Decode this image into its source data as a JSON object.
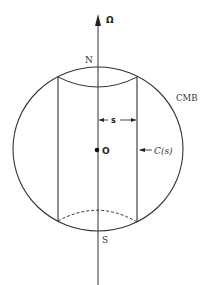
{
  "diagram": {
    "type": "cross-section",
    "labels": {
      "rotation_axis": "Ω",
      "north_pole": "N",
      "south_pole": "S",
      "boundary": "CMB",
      "center": "O",
      "radius_label": "s",
      "cylinder_label": "C(s)"
    },
    "colors": {
      "stroke": "#333333",
      "background": "#ffffff"
    },
    "geometry": {
      "sphere_center": [
        98,
        149
      ],
      "sphere_radius": [
        85,
        82
      ],
      "cylinder_left_x": 58,
      "cylinder_right_x": 137,
      "axis_x": 98
    }
  }
}
